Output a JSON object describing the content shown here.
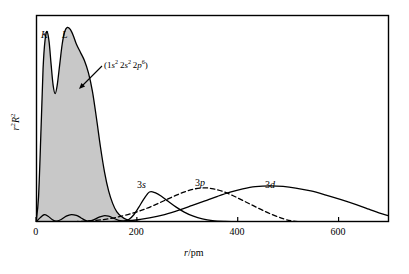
{
  "figure": {
    "type": "radial-distribution-plot",
    "background_color": "#ffffff",
    "frame_color": "#000000",
    "fill_color": "#c8c8c8",
    "curve_color": "#000000"
  },
  "axes": {
    "x_title_html": "r/pm",
    "x_title_italic_part": "r",
    "x_title_rest": "/pm",
    "y_title_italic_part": "r",
    "y_title_sup1": "2",
    "y_title_italic_part2": "R",
    "y_title_sup2": "2",
    "x_ticks": [
      "0",
      "200",
      "400",
      "600"
    ],
    "x_tick_values": [
      0,
      200,
      400,
      600
    ],
    "x_min": 0,
    "x_max": 700,
    "y_min": 0,
    "y_max": 1.0,
    "y_ticks": []
  },
  "annotations": {
    "k_shell_label": "K",
    "l_shell_label": "L",
    "config_prefix": "(1",
    "config_text": "(1s2 2s2 2p6)",
    "orbital_3s": "3s",
    "orbital_3p": "3p",
    "orbital_3d": "3d"
  },
  "chart_data": {
    "type": "line",
    "title": "",
    "xlabel": "r/pm",
    "ylabel": "r²R²",
    "xlim": [
      0,
      700
    ],
    "ylim": [
      0,
      1.0
    ],
    "grid": false,
    "legend": "inline-annotations",
    "series": [
      {
        "name": "core (1s2 2s2 2p6)",
        "style": "solid-filled",
        "fill": "#c8c8c8",
        "label": "(1s2 2s2 2p6)",
        "peak_labels": [
          "K",
          "L"
        ],
        "k_peak_x": 22,
        "k_peak_y": 0.92,
        "l_peak_x": 62,
        "l_peak_y": 0.94,
        "points": [
          [
            0,
            0.0
          ],
          [
            5,
            0.12
          ],
          [
            10,
            0.45
          ],
          [
            14,
            0.74
          ],
          [
            18,
            0.88
          ],
          [
            22,
            0.92
          ],
          [
            26,
            0.87
          ],
          [
            30,
            0.76
          ],
          [
            34,
            0.66
          ],
          [
            38,
            0.62
          ],
          [
            42,
            0.66
          ],
          [
            47,
            0.76
          ],
          [
            52,
            0.86
          ],
          [
            57,
            0.92
          ],
          [
            62,
            0.94
          ],
          [
            68,
            0.93
          ],
          [
            74,
            0.9
          ],
          [
            80,
            0.86
          ],
          [
            88,
            0.82
          ],
          [
            96,
            0.78
          ],
          [
            104,
            0.72
          ],
          [
            112,
            0.63
          ],
          [
            120,
            0.5
          ],
          [
            128,
            0.36
          ],
          [
            136,
            0.24
          ],
          [
            144,
            0.15
          ],
          [
            152,
            0.09
          ],
          [
            160,
            0.05
          ],
          [
            170,
            0.025
          ],
          [
            180,
            0.012
          ],
          [
            195,
            0.005
          ],
          [
            210,
            0.002
          ],
          [
            230,
            0.0
          ],
          [
            700,
            0.0
          ]
        ]
      },
      {
        "name": "3s",
        "style": "solid",
        "label": "3s",
        "peak_x": 225,
        "peak_y": 0.145,
        "points": [
          [
            0,
            0.0
          ],
          [
            8,
            0.02
          ],
          [
            16,
            0.035
          ],
          [
            24,
            0.028
          ],
          [
            32,
            0.012
          ],
          [
            40,
            0.004
          ],
          [
            50,
            0.012
          ],
          [
            60,
            0.028
          ],
          [
            70,
            0.036
          ],
          [
            80,
            0.032
          ],
          [
            88,
            0.022
          ],
          [
            96,
            0.01
          ],
          [
            104,
            0.004
          ],
          [
            114,
            0.01
          ],
          [
            124,
            0.022
          ],
          [
            134,
            0.03
          ],
          [
            144,
            0.028
          ],
          [
            154,
            0.018
          ],
          [
            164,
            0.008
          ],
          [
            174,
            0.004
          ],
          [
            184,
            0.012
          ],
          [
            194,
            0.035
          ],
          [
            204,
            0.072
          ],
          [
            214,
            0.112
          ],
          [
            225,
            0.145
          ],
          [
            236,
            0.142
          ],
          [
            248,
            0.126
          ],
          [
            262,
            0.1
          ],
          [
            278,
            0.072
          ],
          [
            294,
            0.048
          ],
          [
            312,
            0.028
          ],
          [
            330,
            0.015
          ],
          [
            350,
            0.007
          ],
          [
            375,
            0.003
          ],
          [
            400,
            0.001
          ],
          [
            450,
            0.0
          ],
          [
            700,
            0.0
          ]
        ]
      },
      {
        "name": "3p",
        "style": "dashed",
        "label": "3p",
        "peak_x": 335,
        "peak_y": 0.165,
        "points": [
          [
            0,
            0.0
          ],
          [
            40,
            0.0
          ],
          [
            80,
            0.002
          ],
          [
            110,
            0.006
          ],
          [
            140,
            0.014
          ],
          [
            170,
            0.028
          ],
          [
            195,
            0.045
          ],
          [
            215,
            0.062
          ],
          [
            235,
            0.082
          ],
          [
            255,
            0.104
          ],
          [
            275,
            0.126
          ],
          [
            295,
            0.146
          ],
          [
            315,
            0.16
          ],
          [
            335,
            0.165
          ],
          [
            352,
            0.16
          ],
          [
            370,
            0.148
          ],
          [
            390,
            0.128
          ],
          [
            410,
            0.104
          ],
          [
            430,
            0.08
          ],
          [
            450,
            0.056
          ],
          [
            470,
            0.034
          ],
          [
            490,
            0.016
          ],
          [
            505,
            0.006
          ],
          [
            520,
            0.002
          ],
          [
            540,
            0.0
          ],
          [
            700,
            0.0
          ]
        ]
      },
      {
        "name": "3d",
        "style": "solid",
        "label": "3d",
        "peak_x": 465,
        "peak_y": 0.175,
        "points": [
          [
            0,
            0.0
          ],
          [
            100,
            0.0
          ],
          [
            150,
            0.002
          ],
          [
            190,
            0.008
          ],
          [
            225,
            0.02
          ],
          [
            255,
            0.036
          ],
          [
            285,
            0.058
          ],
          [
            310,
            0.08
          ],
          [
            335,
            0.102
          ],
          [
            360,
            0.124
          ],
          [
            385,
            0.144
          ],
          [
            410,
            0.16
          ],
          [
            435,
            0.171
          ],
          [
            465,
            0.175
          ],
          [
            490,
            0.172
          ],
          [
            515,
            0.164
          ],
          [
            545,
            0.15
          ],
          [
            575,
            0.13
          ],
          [
            605,
            0.108
          ],
          [
            635,
            0.084
          ],
          [
            660,
            0.062
          ],
          [
            680,
            0.044
          ],
          [
            700,
            0.03
          ]
        ]
      }
    ]
  },
  "layout": {
    "frame_left": 36,
    "frame_top": 15,
    "frame_right": 389,
    "frame_bottom": 222
  }
}
